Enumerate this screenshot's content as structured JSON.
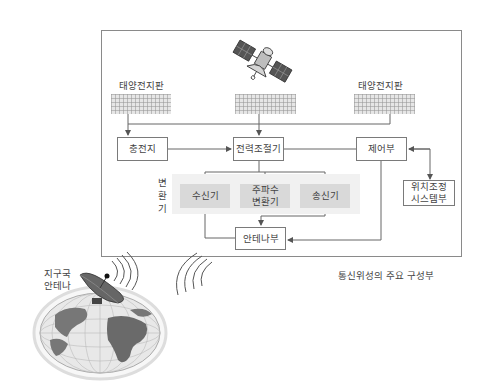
{
  "caption": "통신위성의 주요 구성부",
  "satellite": {
    "solar_panel_left_label": "태양전지판",
    "solar_panel_right_label": "태양전지판",
    "battery": "충전지",
    "power_controller": "전력조절기",
    "control_unit": "제어부",
    "converter_group_label": [
      "변",
      "환",
      "기"
    ],
    "receiver": "수신기",
    "frequency_converter_line1": "주파수",
    "frequency_converter_line2": "변환기",
    "transmitter": "송신기",
    "attitude_system_line1": "위치조정",
    "attitude_system_line2": "시스템부",
    "antenna_unit": "안테나부"
  },
  "ground": {
    "antenna_label_line1": "지구국",
    "antenna_label_line2": "안테나"
  },
  "colors": {
    "frame": "#8a8a8a",
    "box_border": "#7a7a7a",
    "converter_fill": "#d9d9d9",
    "group_fill": "#f1f1f1",
    "line": "#666666"
  }
}
